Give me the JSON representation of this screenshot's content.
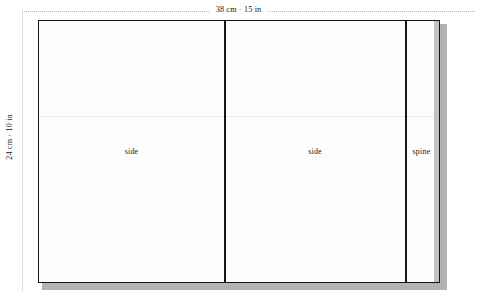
{
  "diagram": {
    "dimensions": {
      "width_label": "38 cm · 15 in",
      "height_label": "24 cm · 10 in"
    },
    "panels": [
      {
        "name": "side-left",
        "label": "side"
      },
      {
        "name": "side-right",
        "label": "side"
      },
      {
        "name": "spine",
        "label": "spine"
      }
    ],
    "colors": {
      "outline": "#161616",
      "panel_fill": "#fdfdfd",
      "shadow": "#b3b3b3",
      "edge_strip": "#c2c2c2",
      "guide": "#b9b9b9",
      "fold_line": "#ebebeb"
    }
  }
}
